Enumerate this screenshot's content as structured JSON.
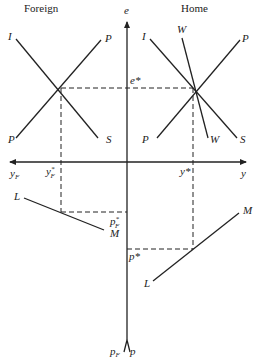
{
  "panels": {
    "foreign": {
      "title": "Foreign"
    },
    "home": {
      "title": "Home"
    }
  },
  "axes": {
    "vertical_top": "e",
    "horizontal_right": "y",
    "horizontal_left_sub": "F",
    "horizontal_left": "y",
    "vertical_bottom_left": "p",
    "vertical_bottom_left_sub": "F",
    "vertical_bottom_right": "p"
  },
  "curves": {
    "foreign_I": "I",
    "foreign_P_top": "P",
    "foreign_P_bottom": "P",
    "foreign_S": "S",
    "home_I": "I",
    "home_W_top": "W",
    "home_P_top": "P",
    "home_P_bottom": "P",
    "home_W_bottom": "W",
    "home_S": "S",
    "foreign_L": "L",
    "foreign_M": "M",
    "home_M": "M",
    "home_L": "L"
  },
  "equilibrium_labels": {
    "e_star": "e*",
    "yF_star_base": "y",
    "yF_star_sup": "*",
    "yF_star_sub": "F",
    "y_star": "y*",
    "pF_star_base": "p",
    "pF_star_sup": "*",
    "pF_star_sub": "F",
    "p_star": "p*"
  }
}
